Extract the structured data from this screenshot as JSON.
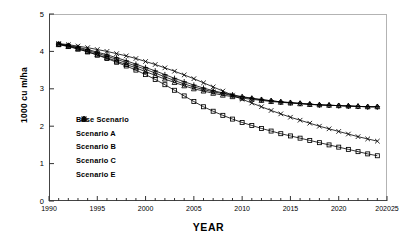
{
  "chart_data": {
    "type": "line",
    "title": "",
    "xlabel": "YEAR",
    "ylabel": "1000 cu m/ha",
    "xlim": [
      1990,
      2025
    ],
    "ylim": [
      0,
      5
    ],
    "xticks": [
      1990,
      1995,
      2000,
      2005,
      2010,
      2015,
      2020,
      2025
    ],
    "xtick_labels": [
      "1990",
      "1995",
      "2000",
      "2005",
      "2010",
      "2015",
      "2020",
      "202025"
    ],
    "yticks": [
      0,
      1,
      2,
      3,
      4,
      5
    ],
    "ytick_labels": [
      "0",
      "1",
      "2",
      "3",
      "4",
      "5"
    ],
    "minor_xtick_interval": 1,
    "grid": false,
    "legend_position": "center-left",
    "x": [
      1991,
      1992,
      1993,
      1994,
      1995,
      1996,
      1997,
      1998,
      1999,
      2000,
      2001,
      2002,
      2003,
      2004,
      2005,
      2006,
      2007,
      2008,
      2009,
      2010,
      2011,
      2012,
      2013,
      2014,
      2015,
      2016,
      2017,
      2018,
      2019,
      2020,
      2021,
      2022,
      2023,
      2024
    ],
    "series": [
      {
        "name": "Base Scenario",
        "marker": "square",
        "values": [
          4.19,
          4.14,
          4.07,
          3.99,
          3.9,
          3.81,
          3.71,
          3.61,
          3.5,
          3.38,
          3.25,
          3.11,
          2.96,
          2.81,
          2.66,
          2.52,
          2.4,
          2.29,
          2.19,
          2.1,
          2.02,
          1.94,
          1.87,
          1.8,
          1.74,
          1.68,
          1.62,
          1.56,
          1.5,
          1.44,
          1.38,
          1.32,
          1.26,
          1.21
        ]
      },
      {
        "name": "Scenario A",
        "marker": "plus",
        "values": [
          4.2,
          4.16,
          4.11,
          4.05,
          3.98,
          3.91,
          3.83,
          3.75,
          3.66,
          3.57,
          3.48,
          3.38,
          3.28,
          3.19,
          3.1,
          3.02,
          2.95,
          2.89,
          2.84,
          2.79,
          2.75,
          2.71,
          2.68,
          2.65,
          2.63,
          2.61,
          2.59,
          2.57,
          2.56,
          2.55,
          2.54,
          2.53,
          2.52,
          2.52
        ]
      },
      {
        "name": "Scenario B",
        "marker": "diamond",
        "values": [
          4.19,
          4.15,
          4.09,
          4.02,
          3.95,
          3.87,
          3.79,
          3.7,
          3.61,
          3.52,
          3.42,
          3.32,
          3.22,
          3.13,
          3.05,
          2.98,
          2.92,
          2.87,
          2.82,
          2.78,
          2.74,
          2.71,
          2.68,
          2.65,
          2.63,
          2.61,
          2.59,
          2.57,
          2.56,
          2.55,
          2.54,
          2.53,
          2.52,
          2.52
        ]
      },
      {
        "name": "Scenario C",
        "marker": "triangle",
        "values": [
          4.18,
          4.13,
          4.06,
          3.99,
          3.91,
          3.83,
          3.74,
          3.65,
          3.56,
          3.46,
          3.36,
          3.26,
          3.17,
          3.08,
          3.0,
          2.94,
          2.88,
          2.83,
          2.79,
          2.75,
          2.72,
          2.69,
          2.66,
          2.64,
          2.62,
          2.6,
          2.58,
          2.57,
          2.56,
          2.55,
          2.54,
          2.53,
          2.52,
          2.52
        ]
      },
      {
        "name": "Scenario E",
        "marker": "cross",
        "values": [
          4.21,
          4.18,
          4.14,
          4.1,
          4.05,
          4.0,
          3.94,
          3.88,
          3.81,
          3.73,
          3.65,
          3.56,
          3.47,
          3.37,
          3.27,
          3.16,
          3.05,
          2.94,
          2.83,
          2.72,
          2.62,
          2.52,
          2.42,
          2.33,
          2.24,
          2.16,
          2.08,
          2.0,
          1.93,
          1.86,
          1.79,
          1.72,
          1.66,
          1.6
        ]
      }
    ]
  }
}
